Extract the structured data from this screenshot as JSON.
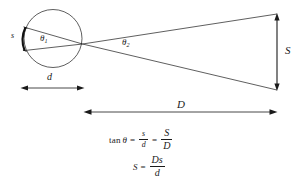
{
  "figure": {
    "stroke_color": "#1a1a1a",
    "background_color": "#ffffff",
    "labels": {
      "arc_s": "s",
      "diameter_d": "d",
      "distance_D": "D",
      "size_S": "S",
      "theta1_base": "θ",
      "theta1_sub": "1",
      "theta2_base": "θ",
      "theta2_sub": "2"
    },
    "equations": [
      {
        "id": "tangent-relation",
        "text": "tan θ = s/d = S/D",
        "parts": {
          "fn": "tan",
          "theta": "θ",
          "equals": "=",
          "frac1_num": "s",
          "frac1_den": "d",
          "equals2": "=",
          "frac2_num": "S",
          "frac2_den": "D"
        }
      },
      {
        "id": "solved-for-S",
        "text": "S = Ds/d",
        "parts": {
          "lhs": "S",
          "equals": "=",
          "frac_num": "Ds",
          "frac_den": "d"
        }
      }
    ],
    "geometry": {
      "circle": {
        "cx": 53,
        "cy": 38.5,
        "r": 29
      },
      "vertex": {
        "x": 82.5,
        "y": 44
      },
      "arc_endpoints_left": [
        {
          "x": 25.4,
          "y": 27.5
        },
        {
          "x": 24.6,
          "y": 50.5
        }
      ],
      "screen_line": {
        "x": 277,
        "top_y": 14,
        "bottom_y": 90
      },
      "d_dimension": {
        "y": 88,
        "x1": 21,
        "x2": 84
      },
      "D_dimension": {
        "y": 112,
        "x1": 84,
        "x2": 277
      }
    }
  }
}
